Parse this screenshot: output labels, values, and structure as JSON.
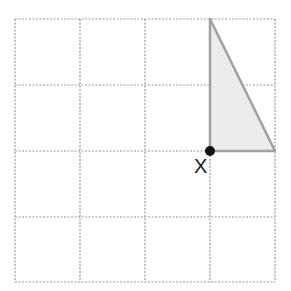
{
  "diagram": {
    "type": "grid-with-shape",
    "grid": {
      "columns": 4,
      "rows": 4,
      "line_color": "#9a9a9a",
      "line_style": "dashed"
    },
    "shape": {
      "type": "right-triangle",
      "fill": "#ececec",
      "stroke": "#a0a0a0",
      "vertices_grid": [
        [
          3,
          0
        ],
        [
          3,
          2
        ],
        [
          4,
          2
        ]
      ]
    },
    "point": {
      "label": "X",
      "grid_position": [
        3,
        2
      ],
      "color": "#111111"
    }
  }
}
